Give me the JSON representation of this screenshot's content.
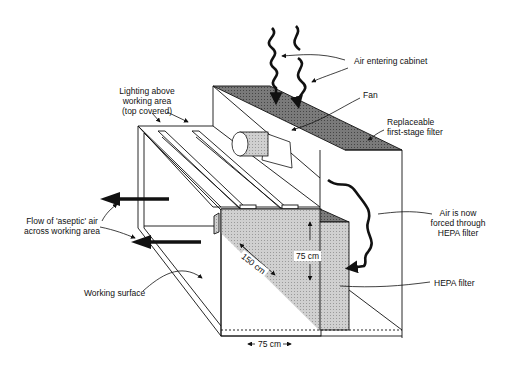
{
  "diagram": {
    "type": "laminar-flow-cabinet-cutaway",
    "labels": {
      "lighting": [
        "Lighting above",
        "working area",
        "(top covered)"
      ],
      "air_entering": "Air entering cabinet",
      "fan": "Fan",
      "first_stage_filter": [
        "Replaceable",
        "first-stage filter"
      ],
      "aseptic_flow": [
        "Flow of 'aseptic' air",
        "across working area"
      ],
      "air_forced": [
        "Air is now",
        "forced through",
        "HEPA filter"
      ],
      "hepa_filter": "HEPA filter",
      "working_surface": "Working surface"
    },
    "dimensions": {
      "depth": "150 cm",
      "height": "75 cm",
      "width": "75 cm"
    },
    "colors": {
      "line": "#111111",
      "filter_dark": "#6e6e6e",
      "hepa_fill": "#c8c8c8",
      "background": "#ffffff"
    }
  }
}
